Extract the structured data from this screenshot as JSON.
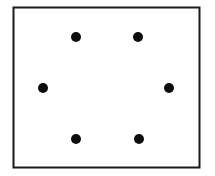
{
  "figure": {
    "title": "Six Dot Hexagonal Pattern",
    "description": "White rectangular panel with thin black outline containing six solid black dots arranged in a hexagon",
    "canvas": {
      "width": 215,
      "height": 176,
      "background_color": "#ffffff"
    },
    "panel": {
      "name": "bounding-rectangle",
      "x": 13.5,
      "y": 7.5,
      "width": 186,
      "height": 160,
      "fill_color": "#ffffff",
      "stroke_color": "#1a1a1a",
      "stroke_width": 2
    },
    "dots": {
      "count": 6,
      "fill_color": "#0d0d0d",
      "radius": 5,
      "items": [
        {
          "name": "dot-top-left",
          "label": "1",
          "cx": 76,
          "cy": 37,
          "r": 5
        },
        {
          "name": "dot-top-right",
          "label": "2",
          "cx": 138,
          "cy": 37,
          "r": 5
        },
        {
          "name": "dot-middle-left",
          "label": "3",
          "cx": 43,
          "cy": 88,
          "r": 5
        },
        {
          "name": "dot-middle-right",
          "label": "4",
          "cx": 169,
          "cy": 88,
          "r": 5
        },
        {
          "name": "dot-bottom-left",
          "label": "5",
          "cx": 76,
          "cy": 139,
          "r": 5
        },
        {
          "name": "dot-bottom-right",
          "label": "6",
          "cx": 139,
          "cy": 139,
          "r": 5
        }
      ]
    }
  },
  "chart_data": {
    "type": "scatter",
    "title": "Six Dot Hexagonal Pattern",
    "subtitle": "",
    "xlabel": "",
    "ylabel": "",
    "xlim": [
      13,
      200
    ],
    "ylim": [
      7,
      168
    ],
    "grid": false,
    "legend": false,
    "axes_visible": false,
    "frame_visible": true,
    "marker": "filled-circle",
    "marker_color": "#0d0d0d",
    "marker_size": 10,
    "series": [
      {
        "name": "dots",
        "x": [
          76,
          138,
          43,
          169,
          76,
          139
        ],
        "y": [
          37,
          37,
          88,
          88,
          139,
          139
        ],
        "point_names": [
          "dot-top-left",
          "dot-top-right",
          "dot-middle-left",
          "dot-middle-right",
          "dot-bottom-left",
          "dot-bottom-right"
        ]
      }
    ],
    "annotations": []
  }
}
